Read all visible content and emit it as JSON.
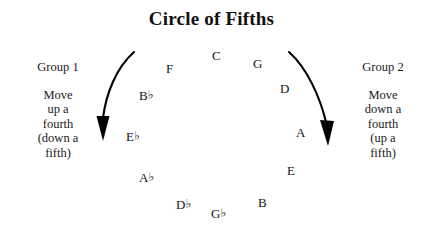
{
  "title": "Circle of Fifths",
  "left_group": {
    "heading": "Group 1",
    "lines": [
      "Move",
      "up a",
      "fourth",
      "(down a",
      "fifth)"
    ]
  },
  "right_group": {
    "heading": "Group 2",
    "lines": [
      "Move",
      "down a",
      "fourth",
      "(up a",
      "fifth)"
    ]
  },
  "notes": [
    {
      "label": "C",
      "letter": "C",
      "accidental": "",
      "x": 212,
      "y": 49
    },
    {
      "label": "G",
      "letter": "G",
      "accidental": "",
      "x": 253,
      "y": 57
    },
    {
      "label": "D",
      "letter": "D",
      "accidental": "",
      "x": 280,
      "y": 82
    },
    {
      "label": "A",
      "letter": "A",
      "accidental": "",
      "x": 296,
      "y": 126
    },
    {
      "label": "E",
      "letter": "E",
      "accidental": "",
      "x": 287,
      "y": 164
    },
    {
      "label": "B",
      "letter": "B",
      "accidental": "",
      "x": 258,
      "y": 196
    },
    {
      "label": "G♭",
      "letter": "G",
      "accidental": "♭",
      "x": 211,
      "y": 207
    },
    {
      "label": "D♭",
      "letter": "D",
      "accidental": "♭",
      "x": 176,
      "y": 198
    },
    {
      "label": "A♭",
      "letter": "A",
      "accidental": "♭",
      "x": 139,
      "y": 171
    },
    {
      "label": "E♭",
      "letter": "E",
      "accidental": "♭",
      "x": 126,
      "y": 130
    },
    {
      "label": "B♭",
      "letter": "B",
      "accidental": "♭",
      "x": 139,
      "y": 89
    },
    {
      "label": "F",
      "letter": "F",
      "accidental": "",
      "x": 166,
      "y": 62
    }
  ],
  "arrows": {
    "left": {
      "name": "left-curved-arrow",
      "direction": "down-left",
      "color": "#000000"
    },
    "right": {
      "name": "right-curved-arrow",
      "direction": "down-right",
      "color": "#000000"
    }
  },
  "colors": {
    "background": "#ffffff",
    "ink": "#151515"
  }
}
